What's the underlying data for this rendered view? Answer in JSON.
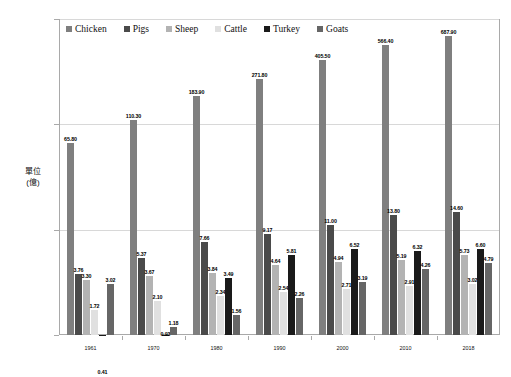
{
  "chart_data": {
    "type": "bar",
    "title": "",
    "xlabel": "",
    "ylabel": "單位\n(億)",
    "ylabel_line1": "單位",
    "ylabel_line2": "(億)",
    "yscale": "log",
    "ylim": [
      1,
      1000
    ],
    "ytick_labels": [
      "1.00",
      "10.00",
      "100.00",
      "1,000.00"
    ],
    "ytick_values": [
      1,
      10,
      100,
      1000
    ],
    "grid": true,
    "legend_position": "top-left-inside",
    "categories": [
      "1961",
      "1970",
      "1980",
      "1990",
      "2000",
      "2010",
      "2018"
    ],
    "series": [
      {
        "name": "Chicken",
        "color": "#7f7f7f",
        "values": [
          65.8,
          110.3,
          183.9,
          271.8,
          405.5,
          566.4,
          687.9
        ],
        "labels": [
          "65.80",
          "110.30",
          "183.90",
          "271.80",
          "405.50",
          "566.40",
          "687.90"
        ]
      },
      {
        "name": "Pigs",
        "color": "#4a4a4a",
        "values": [
          3.76,
          5.37,
          7.66,
          9.17,
          11.0,
          13.8,
          14.6
        ],
        "labels": [
          "3.76",
          "5.37",
          "7.66",
          "9.17",
          "11.00",
          "13.80",
          "14.60"
        ]
      },
      {
        "name": "Sheep",
        "color": "#b3b3b3",
        "values": [
          3.3,
          3.67,
          3.84,
          4.64,
          4.94,
          5.19,
          5.73
        ],
        "labels": [
          "3.30",
          "3.67",
          "3.84",
          "4.64",
          "4.94",
          "5.19",
          "5.73"
        ]
      },
      {
        "name": "Cattle",
        "color": "#e0e0e0",
        "values": [
          1.72,
          2.1,
          2.34,
          2.54,
          2.71,
          2.91,
          3.02
        ],
        "labels": [
          "1.72",
          "2.10",
          "2.34",
          "2.54",
          "2.71",
          "2.91",
          "3.02"
        ]
      },
      {
        "name": "Turkey",
        "color": "#1a1a1a",
        "values": [
          0.41,
          0.93,
          3.49,
          5.81,
          6.52,
          6.32,
          6.6
        ],
        "labels": [
          "0.41",
          "0.93",
          "3.49",
          "5.81",
          "6.52",
          "6.32",
          "6.60"
        ]
      },
      {
        "name": "Goats",
        "color": "#666666",
        "values": [
          3.02,
          1.18,
          1.56,
          2.26,
          3.19,
          4.26,
          4.79
        ],
        "labels": [
          "3.02",
          "1.18",
          "1.56",
          "2.26",
          "3.19",
          "4.26",
          "4.79"
        ]
      }
    ]
  }
}
